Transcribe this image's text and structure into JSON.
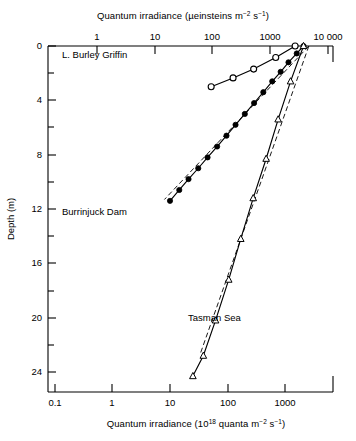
{
  "figure": {
    "background": "#ffffff",
    "ink": "#000000"
  },
  "axes": {
    "top": {
      "title_prefix": "Quantum irradiance (µeinsteins m",
      "title_sup1": "−2",
      "title_mid": " s",
      "title_sup2": "−1",
      "title_suffix": ")",
      "title_full": "Quantum irradiance (µeinsteins m−2 s−1)",
      "scale": "log",
      "ticks": [
        "1",
        "10",
        "100",
        "1000",
        "10 000"
      ],
      "tick_values": [
        1,
        10,
        100,
        1000,
        10000
      ],
      "range": [
        0.1,
        100000
      ]
    },
    "bottom": {
      "title_prefix": "Quantum irradiance (10",
      "title_sup1": "18",
      "title_mid": " quanta m",
      "title_sup2": "−2",
      "title_mid2": " s",
      "title_sup3": "−1",
      "title_suffix": ")",
      "title_full": "Quantum irradiance (10¹⁸ quanta m−2 s−1)",
      "scale": "log",
      "ticks": [
        "0.1",
        "1",
        "10",
        "100",
        "1000"
      ],
      "tick_values": [
        0.1,
        1,
        10,
        100,
        1000
      ],
      "range": [
        0.01,
        10000
      ]
    },
    "left": {
      "title": "Depth (m)",
      "scale": "linear",
      "ticks": [
        "0",
        "4",
        "8",
        "12",
        "16",
        "20",
        "24"
      ],
      "tick_values": [
        0,
        4,
        8,
        12,
        16,
        20,
        24
      ],
      "minor_tick_values": [
        2,
        6,
        10,
        14,
        18,
        22
      ],
      "range": [
        0,
        25.4
      ],
      "direction": "inverted"
    }
  },
  "chart_data": {
    "type": "line",
    "title": "",
    "xlabel": "Quantum irradiance (10¹⁸ quanta m⁻² s⁻¹)",
    "ylabel": "Depth (m)",
    "xscale": "log",
    "yscale": "linear",
    "xlim": [
      0.01,
      10000
    ],
    "ylim": [
      0,
      25.4
    ],
    "y_inverted": true,
    "grid": false,
    "legend": "inline-annotations",
    "series": [
      {
        "name": "L. Burley Griffin",
        "marker": "open-circle",
        "linestyle": "solid",
        "color": "#000000",
        "points": [
          {
            "x": 1500,
            "y": 0.0
          },
          {
            "x": 690,
            "y": 0.85
          },
          {
            "x": 285,
            "y": 1.7
          },
          {
            "x": 125,
            "y": 2.35
          },
          {
            "x": 52,
            "y": 3.0
          }
        ]
      },
      {
        "name": "Burrinjuck Dam",
        "marker": "filled-circle",
        "linestyle": "solid",
        "color": "#000000",
        "points": [
          {
            "x": 2100,
            "y": 0.0
          },
          {
            "x": 1600,
            "y": 0.55
          },
          {
            "x": 1150,
            "y": 1.2
          },
          {
            "x": 840,
            "y": 1.9
          },
          {
            "x": 600,
            "y": 2.6
          },
          {
            "x": 420,
            "y": 3.4
          },
          {
            "x": 290,
            "y": 4.2
          },
          {
            "x": 200,
            "y": 5.0
          },
          {
            "x": 138,
            "y": 5.8
          },
          {
            "x": 96,
            "y": 6.6
          },
          {
            "x": 66,
            "y": 7.4
          },
          {
            "x": 45,
            "y": 8.2
          },
          {
            "x": 31,
            "y": 9.0
          },
          {
            "x": 21,
            "y": 9.8
          },
          {
            "x": 14.5,
            "y": 10.6
          },
          {
            "x": 10,
            "y": 11.4
          }
        ]
      },
      {
        "name": "Tasman Sea",
        "marker": "open-triangle",
        "linestyle": "solid",
        "color": "#000000",
        "points": [
          {
            "x": 2100,
            "y": 0.0
          },
          {
            "x": 1250,
            "y": 2.6
          },
          {
            "x": 760,
            "y": 5.4
          },
          {
            "x": 470,
            "y": 8.3
          },
          {
            "x": 280,
            "y": 11.2
          },
          {
            "x": 170,
            "y": 14.2
          },
          {
            "x": 105,
            "y": 17.2
          },
          {
            "x": 62,
            "y": 20.2
          },
          {
            "x": 38,
            "y": 22.8
          },
          {
            "x": 25,
            "y": 24.3
          }
        ]
      }
    ],
    "trend_lines": [
      {
        "name": "dashed-extrapolation-upper",
        "linestyle": "dashed",
        "points": [
          {
            "x": 2600,
            "y": 0.0
          },
          {
            "x": 8.0,
            "y": 11.3
          }
        ]
      },
      {
        "name": "dashed-extrapolation-lower",
        "linestyle": "dashed",
        "points": [
          {
            "x": 2600,
            "y": 0.0
          },
          {
            "x": 34,
            "y": 22.6
          }
        ]
      }
    ],
    "annotations": [
      {
        "text": "L. Burley Griffin",
        "x_px": 62,
        "y_px": 58
      },
      {
        "text": "Burrinjuck Dam",
        "x_px": 62,
        "y_px": 215
      },
      {
        "text": "Tasman Sea",
        "x_px": 188,
        "y_px": 321
      }
    ]
  }
}
